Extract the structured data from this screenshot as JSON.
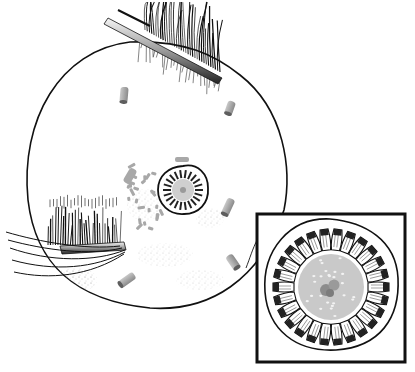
{
  "illustration": {
    "subject": "cell with cilia bundles, scattered rod fragments and a central ring structure, with magnified inset",
    "colors": {
      "background": "#ffffff",
      "outline": "#111111",
      "rod_fill": "#a9a9a9",
      "rod_shade": "#6e6e6e",
      "core_fill": "#c9c9c9",
      "core_spot": "#f2f2f2",
      "nucleus_fill": "#8e8e8e",
      "stipple": "#777777"
    },
    "parts": {
      "cell": "cell-membrane",
      "top_bundle": "ciliary-bundle-top",
      "left_bundle": "ciliary-bundle-left",
      "center_ring": "central-ring-structure",
      "inset": "magnified-inset",
      "rods": "scattered-rod-fragments"
    },
    "counts": {
      "inset_segments": 26,
      "center_ring_segments": 22,
      "scattered_rods": 5
    }
  }
}
